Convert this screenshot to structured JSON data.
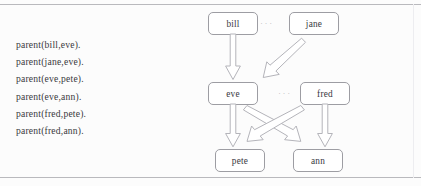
{
  "figure": {
    "name": "prolog-family-tree-figure",
    "background": "#fcfcfc",
    "rule_color": "#b9b9bd",
    "box_border_color": "#9d9da3",
    "arrow_stroke_color": "#b4b4ba",
    "text_color": "#3a3a40"
  },
  "facts": {
    "label": "prolog-facts",
    "lines": [
      "parent(bill,eve).",
      "parent(jane,eve).",
      "parent(eve,pete).",
      "parent(eve,ann).",
      "parent(fred,pete).",
      "parent(fred,ann)."
    ]
  },
  "diagram": {
    "ellipsis_glyph": "···",
    "nodes": [
      {
        "id": "bill",
        "label": "bill",
        "row": "top"
      },
      {
        "id": "jane",
        "label": "jane",
        "row": "top"
      },
      {
        "id": "eve",
        "label": "eve",
        "row": "middle"
      },
      {
        "id": "fred",
        "label": "fred",
        "row": "middle"
      },
      {
        "id": "pete",
        "label": "pete",
        "row": "bottom"
      },
      {
        "id": "ann",
        "label": "ann",
        "row": "bottom"
      }
    ],
    "edges": [
      {
        "from": "bill",
        "to": "eve",
        "kind": "vertical"
      },
      {
        "from": "jane",
        "to": "eve",
        "kind": "diagonal-down-left"
      },
      {
        "from": "eve",
        "to": "pete",
        "kind": "vertical"
      },
      {
        "from": "eve",
        "to": "ann",
        "kind": "diagonal-down-right"
      },
      {
        "from": "fred",
        "to": "pete",
        "kind": "diagonal-down-left"
      },
      {
        "from": "fred",
        "to": "ann",
        "kind": "vertical"
      }
    ],
    "ellipses": [
      {
        "id": "ellipsis-top",
        "between": "bill-jane"
      },
      {
        "id": "ellipsis-middle",
        "between": "eve-fred"
      }
    ]
  }
}
